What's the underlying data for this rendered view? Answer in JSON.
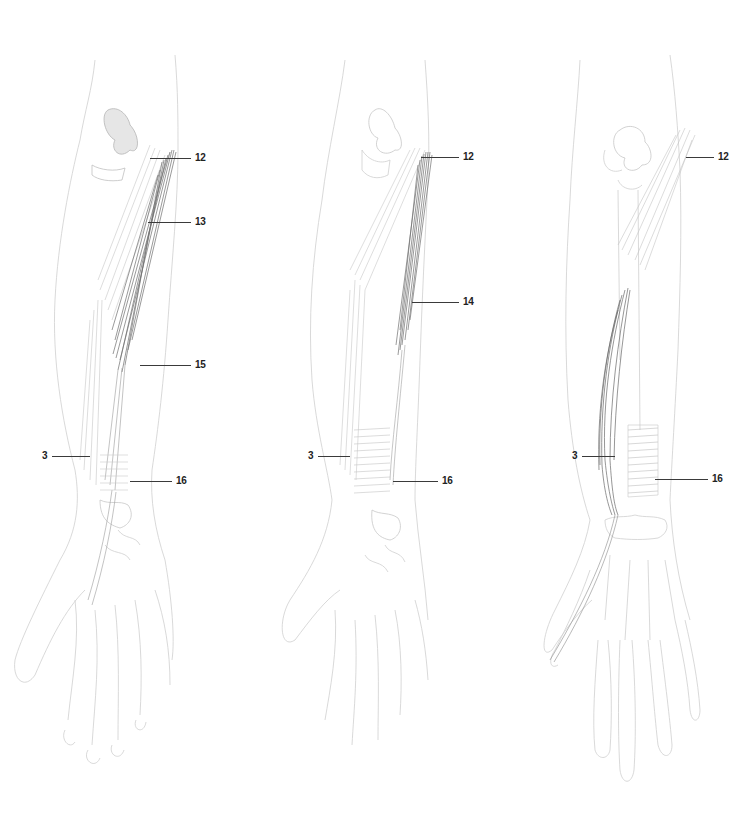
{
  "figure": {
    "panels": [
      {
        "id": "left",
        "labels": [
          {
            "text": "12",
            "x": 195,
            "y": 158,
            "line_from": 150,
            "line_to": 191
          },
          {
            "text": "13",
            "x": 195,
            "y": 222,
            "line_from": 148,
            "line_to": 191
          },
          {
            "text": "15",
            "x": 195,
            "y": 365,
            "line_from": 140,
            "line_to": 191
          },
          {
            "text": "3",
            "x": 42,
            "y": 456,
            "line_from": 52,
            "line_to": 90
          },
          {
            "text": "16",
            "x": 176,
            "y": 481,
            "line_from": 130,
            "line_to": 172
          }
        ]
      },
      {
        "id": "middle",
        "labels": [
          {
            "text": "12",
            "x": 463,
            "y": 157,
            "line_from": 421,
            "line_to": 459
          },
          {
            "text": "14",
            "x": 463,
            "y": 302,
            "line_from": 412,
            "line_to": 459
          },
          {
            "text": "3",
            "x": 308,
            "y": 456,
            "line_from": 318,
            "line_to": 350
          },
          {
            "text": "16",
            "x": 442,
            "y": 481,
            "line_from": 393,
            "line_to": 438
          }
        ]
      },
      {
        "id": "right",
        "labels": [
          {
            "text": "12",
            "x": 718,
            "y": 157,
            "line_from": 686,
            "line_to": 714
          },
          {
            "text": "3",
            "x": 572,
            "y": 456,
            "line_from": 582,
            "line_to": 615
          },
          {
            "text": "16",
            "x": 712,
            "y": 479,
            "line_from": 655,
            "line_to": 708
          }
        ]
      }
    ],
    "colors": {
      "outline": "#c8c8c8",
      "muscle_dark": "#6e6e6e",
      "muscle_light": "#bdbdbd",
      "label": "#222222",
      "leader": "#3a3a3a"
    }
  }
}
